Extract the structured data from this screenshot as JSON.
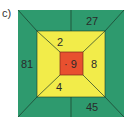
{
  "label": "c)",
  "colors": {
    "outer": "#2e9a6e",
    "middle": "#f2ec4a",
    "inner": "#e8502f",
    "lines": "#1a3a2a",
    "text": "#2a2a2a"
  },
  "diagram": {
    "center": "· 9",
    "middle_ring": {
      "top": "2",
      "right": "8",
      "bottom": "4"
    },
    "outer_ring": {
      "left": "81",
      "top": "27",
      "bottom": "45"
    }
  }
}
